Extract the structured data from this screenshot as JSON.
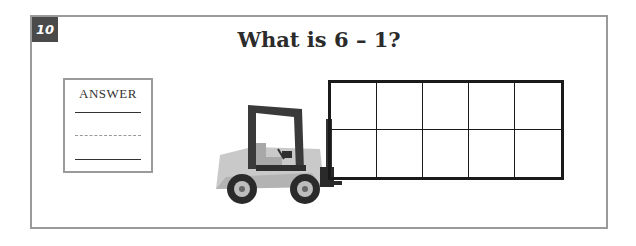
{
  "question": {
    "number": "10",
    "title": "What is 6 – 1?"
  },
  "answer_box": {
    "label": "ANSWER",
    "value": ""
  },
  "ten_frame": {
    "rows": 2,
    "columns": 5,
    "filled": 0
  },
  "colors": {
    "border": "#9a9a9a",
    "badge": "#4a4a4a",
    "frame": "#1a1a1a",
    "forklift_body": "#c2c2c2",
    "forklift_dark": "#3a3a3a"
  }
}
